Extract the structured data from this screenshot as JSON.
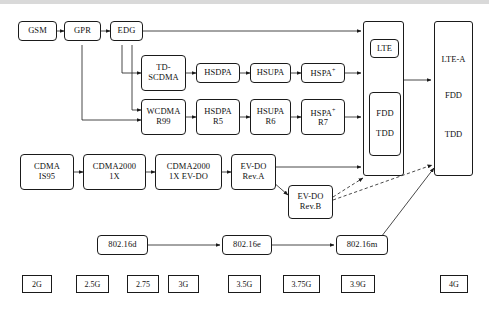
{
  "diagram": {
    "gsm_row": [
      {
        "id": "gsm",
        "lines": [
          "GSM"
        ]
      },
      {
        "id": "gpr",
        "lines": [
          "GPR"
        ]
      },
      {
        "id": "edg",
        "lines": [
          "EDG"
        ]
      }
    ],
    "td_row": [
      {
        "id": "td-scdma",
        "lines": [
          "TD-",
          "SCDMA"
        ]
      },
      {
        "id": "hsdpa",
        "lines": [
          "HSDPA"
        ]
      },
      {
        "id": "hsupa",
        "lines": [
          "HSUPA"
        ]
      },
      {
        "id": "hspa-plus",
        "lines": [
          "HSPA"
        ],
        "sup": "+"
      }
    ],
    "wcdma_row": [
      {
        "id": "wcdma-r99",
        "lines": [
          "WCDMA",
          "R99"
        ]
      },
      {
        "id": "hsdpa-r5",
        "lines": [
          "HSDPA",
          "R5"
        ]
      },
      {
        "id": "hsupa-r6",
        "lines": [
          "HSUPA",
          "R6"
        ]
      },
      {
        "id": "hspa-plus-r7",
        "lines": [
          "HSPA",
          "R7"
        ],
        "sup": "+"
      }
    ],
    "cdma_row": [
      {
        "id": "cdma-is95",
        "lines": [
          "CDMA",
          "IS95"
        ]
      },
      {
        "id": "cdma2000-1x",
        "lines": [
          "CDMA2000",
          "1X"
        ]
      },
      {
        "id": "cdma2000-1x-evdo",
        "lines": [
          "CDMA2000",
          "1X EV-DO"
        ]
      },
      {
        "id": "evdo-reva",
        "lines": [
          "EV-DO",
          "Rev.A"
        ]
      },
      {
        "id": "evdo-revb",
        "lines": [
          "EV-DO",
          "Rev.B"
        ]
      }
    ],
    "wimax_row": [
      {
        "id": "80216d",
        "lines": [
          "802.16d"
        ]
      },
      {
        "id": "80216e",
        "lines": [
          "802.16e"
        ]
      },
      {
        "id": "80216m",
        "lines": [
          "802.16m"
        ]
      }
    ],
    "lte_group": {
      "id": "lte-group",
      "lte_label": "LTE",
      "duplex": [
        "FDD",
        "TDD"
      ]
    },
    "lte_a_group": {
      "id": "lte-a-group",
      "labels": [
        "LTE-A",
        "FDD",
        "TDD"
      ]
    },
    "generations": [
      {
        "id": "gen-2g",
        "label": "2G"
      },
      {
        "id": "gen-25g",
        "label": "2.5G"
      },
      {
        "id": "gen-275",
        "label": "2.75"
      },
      {
        "id": "gen-3g",
        "label": "3G"
      },
      {
        "id": "gen-35g",
        "label": "3.5G"
      },
      {
        "id": "gen-375g",
        "label": "3.75G"
      },
      {
        "id": "gen-39g",
        "label": "3.9G"
      },
      {
        "id": "gen-4g",
        "label": "4G"
      }
    ],
    "colors": {
      "stroke": "#1a1a1a",
      "background": "#ffffff"
    }
  }
}
